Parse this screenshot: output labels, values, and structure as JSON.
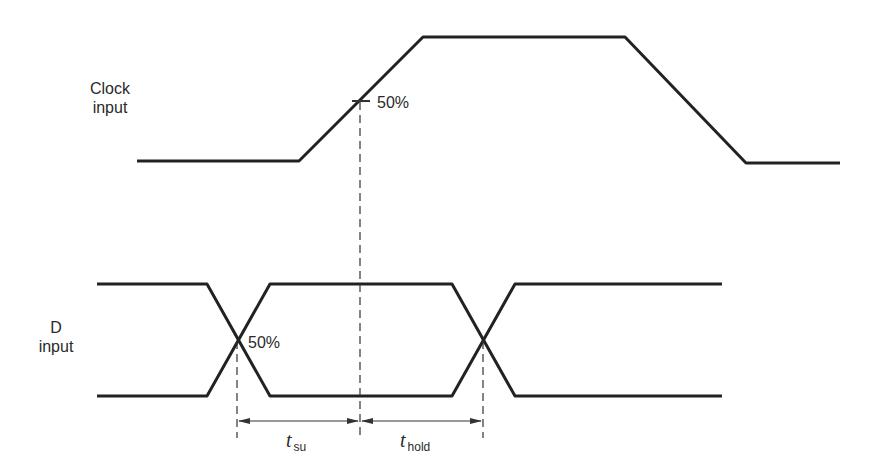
{
  "diagram": {
    "type": "timing-diagram",
    "signals": [
      {
        "name": "Clock input",
        "label_line1": "Clock",
        "label_line2": "input",
        "waveform": "low → rising edge → high → falling edge → low",
        "marker": "50%"
      },
      {
        "name": "D input",
        "label_line1": "D",
        "label_line2": "input",
        "waveform": "data transition (crossing) → stable → data transition (crossing)",
        "marker": "50%"
      }
    ],
    "annotations": {
      "clock_marker": "50%",
      "data_marker": "50%",
      "setup_time": {
        "symbol": "t",
        "subscript": "su"
      },
      "hold_time": {
        "symbol": "t",
        "subscript": "hold"
      }
    },
    "colors": {
      "stroke": "#222222",
      "background": "#ffffff"
    }
  }
}
